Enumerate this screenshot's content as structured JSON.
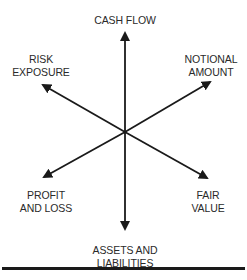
{
  "diagram": {
    "type": "radial-arrows",
    "center": {
      "x": 125,
      "y": 132
    },
    "line_color": "#1a1a1a",
    "text_color": "#2a2a2a",
    "nodes": [
      {
        "id": "cash-flow",
        "lines": [
          "CASH FLOW"
        ],
        "direction": "up"
      },
      {
        "id": "notional-amount",
        "lines": [
          "NOTIONAL",
          "AMOUNT"
        ],
        "direction": "upper-right"
      },
      {
        "id": "fair-value",
        "lines": [
          "FAIR",
          "VALUE"
        ],
        "direction": "lower-right"
      },
      {
        "id": "assets-and-liabilities",
        "lines": [
          "ASSETS AND",
          "LIABILITIES"
        ],
        "direction": "down"
      },
      {
        "id": "profit-and-loss",
        "lines": [
          "PROFIT",
          "AND LOSS"
        ],
        "direction": "lower-left"
      },
      {
        "id": "risk-exposure",
        "lines": [
          "RISK",
          "EXPOSURE"
        ],
        "direction": "upper-left"
      }
    ]
  }
}
